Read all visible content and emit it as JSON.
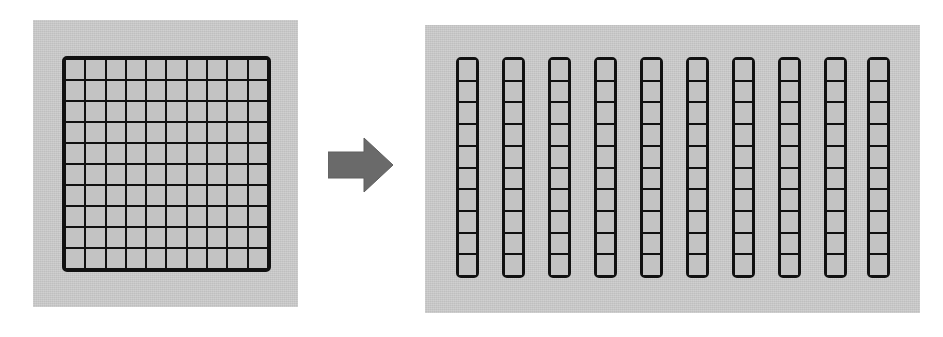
{
  "figure": {
    "background_color": "#ffffff",
    "panel_color": "#c9c9c9",
    "line_color": "#111111",
    "cell_fill_color": "#c3c3c3",
    "arrow_color": "#6a6a6a"
  },
  "left_panel": {
    "name": "hundred-flat",
    "label": "hundred square",
    "columns": 10,
    "rows": 10,
    "total_units": 100
  },
  "arrow": {
    "name": "right-arrow",
    "direction": "right",
    "label": "becomes",
    "color": "#6a6a6a"
  },
  "right_panel": {
    "name": "tens-rods",
    "label": "ten rods of ten",
    "rod_count": 10,
    "cells_per_rod": 10,
    "total_units": 100,
    "rod_left_positions": [
      0,
      46,
      92,
      138,
      184,
      230,
      276,
      322,
      368,
      411
    ]
  }
}
